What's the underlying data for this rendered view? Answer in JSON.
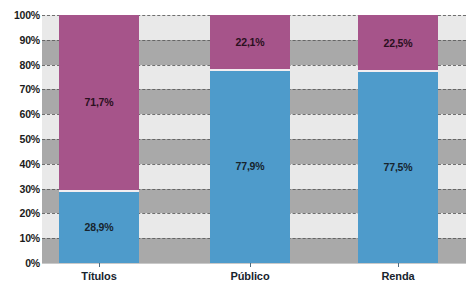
{
  "chart_data": {
    "type": "bar",
    "subtype": "stacked-100-percent",
    "title": "",
    "subtitle": "",
    "xlabel": "",
    "ylabel": "",
    "categories": [
      "Títulos",
      "Público",
      "Renda"
    ],
    "series": [
      {
        "name": "blue-series",
        "color": "#4e9bcb",
        "values": [
          28.9,
          77.9,
          77.5
        ],
        "labels": [
          "28,9%",
          "77,9%",
          "77,5%"
        ]
      },
      {
        "name": "purple-series",
        "color": "#a6548a",
        "values": [
          71.7,
          22.1,
          22.5
        ],
        "labels": [
          "71,7%",
          "22,1%",
          "22,5%"
        ]
      }
    ],
    "ylim": [
      0,
      100
    ],
    "ytick_values": [
      0,
      10,
      20,
      30,
      40,
      50,
      60,
      70,
      80,
      90,
      100
    ],
    "ytick_labels": [
      "0%",
      "10%",
      "20%",
      "30%",
      "40%",
      "50%",
      "60%",
      "70%",
      "80%",
      "90%",
      "100%"
    ],
    "grid": true,
    "grid_style": "dashed",
    "legend": "none",
    "background_bands": [
      "#e9e9e9",
      "#a9a9a9"
    ]
  },
  "axis": {
    "y_labels": [
      "100%",
      "90%",
      "80%",
      "70%",
      "60%",
      "50%",
      "40%",
      "30%",
      "20%",
      "10%",
      "0%"
    ],
    "x_labels": [
      "Títulos",
      "Público",
      "Renda"
    ]
  },
  "bars": [
    {
      "category": "Títulos",
      "bottom_label": "28,9%",
      "top_label": "71,7%",
      "bottom_value": 28.9,
      "top_value": 71.7
    },
    {
      "category": "Público",
      "bottom_label": "77,9%",
      "top_label": "22,1%",
      "bottom_value": 77.9,
      "top_value": 22.1
    },
    {
      "category": "Renda",
      "bottom_label": "77,5%",
      "top_label": "22,5%",
      "bottom_value": 77.5,
      "top_value": 22.5
    }
  ],
  "colors": {
    "blue": "#4e9bcb",
    "purple": "#a6548a",
    "band_light": "#e9e9e9",
    "band_dark": "#a9a9a9",
    "gridline": "#5a5a5a",
    "text": "#17242e"
  }
}
